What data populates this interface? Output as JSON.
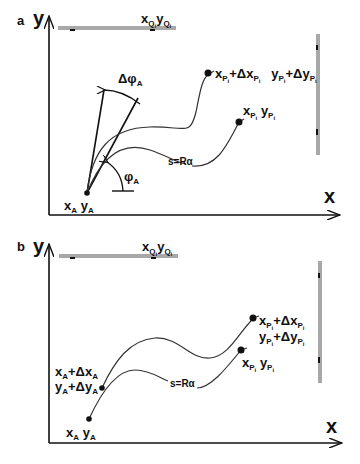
{
  "panels": [
    {
      "id": "a",
      "letter": "a",
      "y_axis_label": "y",
      "x_axis_label": "x",
      "top_obstacle_label": {
        "x": "x",
        "x_sub": "Q",
        "x_subsub": "i",
        "y": "y",
        "y_sub": "Q",
        "y_subsub": "i"
      },
      "start_point_label": {
        "x": "x",
        "x_sub": "A",
        "y": "y",
        "y_sub": "A"
      },
      "delta_phi_label": {
        "sym": "Δφ",
        "sub": "A"
      },
      "phi_label": {
        "sym": "φ",
        "sub": "A"
      },
      "arc_label": "s=Rα",
      "end_point_label": {
        "x": "x",
        "x_sub": "P",
        "x_subsub": "i",
        "y": "y",
        "y_sub": "P",
        "y_subsub": "i"
      },
      "end_point_delta_label": {
        "x": "x",
        "x_sub": "P",
        "x_subsub": "i",
        "plus_dx": "+Δx",
        "dx_sub": "P",
        "dx_subsub": "i",
        "y": "y",
        "y_sub": "P",
        "y_subsub": "i",
        "plus_dy": "+Δy",
        "dy_sub": "P",
        "dy_subsub": "i"
      }
    },
    {
      "id": "b",
      "letter": "b",
      "y_axis_label": "y",
      "x_axis_label": "x",
      "top_obstacle_label": {
        "x": "x",
        "x_sub": "Q",
        "x_subsub": "i",
        "y": "y",
        "y_sub": "Q",
        "y_subsub": "i"
      },
      "start_point_label": {
        "x": "x",
        "x_sub": "A",
        "y": "y",
        "y_sub": "A"
      },
      "start_delta_label": {
        "x_line": "x",
        "x_sub": "A",
        "plus_dx": "+Δx",
        "dx_sub": "A",
        "y_line": "y",
        "y_sub": "A",
        "plus_dy": "+Δy",
        "dy_sub": "A"
      },
      "arc_label": "s=Rα",
      "end_point_label": {
        "x": "x",
        "x_sub": "P",
        "x_subsub": "i",
        "y": "y",
        "y_sub": "P",
        "y_subsub": "i"
      },
      "end_point_delta_label": {
        "x": "x",
        "x_sub": "P",
        "x_subsub": "i",
        "plus_dx": "+Δx",
        "dx_sub": "P",
        "dx_subsub": "i",
        "y": "y",
        "y_sub": "P",
        "y_subsub": "i",
        "plus_dy": "+Δy",
        "dy_sub": "P",
        "dy_subsub": "i"
      }
    }
  ],
  "colors": {
    "ink": "#111111",
    "curve": "#333333",
    "obstacle": "#a8a8a8"
  }
}
